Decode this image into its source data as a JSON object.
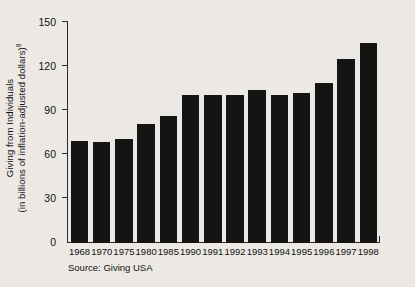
{
  "chart_data": {
    "type": "bar",
    "title": "",
    "subtitle": "",
    "xlabel": "",
    "ylabel_line1": "Giving from Individuals",
    "ylabel_line2": "(in billions of inflation-adjusted dollars)",
    "ylabel_superscript": "8",
    "categories": [
      "1968",
      "1970",
      "1975",
      "1980",
      "1985",
      "1990",
      "1991",
      "1992",
      "1993",
      "1994",
      "1995",
      "1996",
      "1997",
      "1998"
    ],
    "values": [
      69,
      68,
      70,
      80,
      86,
      100,
      100,
      100,
      103,
      100,
      101,
      108,
      124,
      135
    ],
    "ylim": [
      0,
      150
    ],
    "yticks": [
      0,
      30,
      60,
      90,
      120,
      150
    ],
    "ytick_labels": [
      "0",
      "30",
      "60",
      "90",
      "120",
      "150"
    ],
    "grid": false,
    "legend": null,
    "bar_color": "#141414",
    "axis_color": "#2b2b2b",
    "background_color": "#ece9e4",
    "source_note": "Source: Giving USA"
  }
}
